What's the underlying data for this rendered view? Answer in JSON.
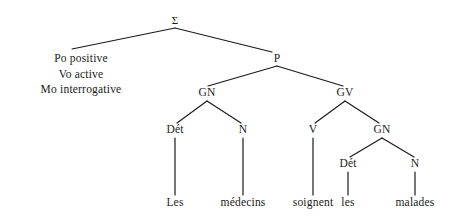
{
  "diagram": {
    "type": "syntax-tree",
    "title": "",
    "line_color": "#1a1a1a",
    "text_color": "#1a1a1a",
    "background_color": "#ffffff",
    "root": {
      "label": "Σ",
      "x": 175,
      "y": 20
    },
    "features": [
      {
        "label": "Po positive"
      },
      {
        "label": "Vo active"
      },
      {
        "label": "Mo interrogative"
      }
    ],
    "nodes": [
      {
        "id": "P",
        "label": "P",
        "x": 277,
        "y": 59
      },
      {
        "id": "GN1",
        "label": "GN",
        "x": 207,
        "y": 93
      },
      {
        "id": "GV",
        "label": "GV",
        "x": 345,
        "y": 93
      },
      {
        "id": "DET1",
        "label": "Dét",
        "x": 175,
        "y": 130
      },
      {
        "id": "N1",
        "label": "N",
        "x": 243,
        "y": 130
      },
      {
        "id": "V",
        "label": "V",
        "x": 313,
        "y": 130
      },
      {
        "id": "GN2",
        "label": "GN",
        "x": 382,
        "y": 130
      },
      {
        "id": "DET2",
        "label": "Dét",
        "x": 348,
        "y": 164
      },
      {
        "id": "N2",
        "label": "N",
        "x": 415,
        "y": 164
      }
    ],
    "terminals": [
      {
        "id": "les1",
        "label": "Les",
        "x": 175,
        "y": 203
      },
      {
        "id": "medecins",
        "label": "médecins",
        "x": 243,
        "y": 203
      },
      {
        "id": "soignent",
        "label": "soignent",
        "x": 313,
        "y": 203
      },
      {
        "id": "les2",
        "label": "les",
        "x": 348,
        "y": 203
      },
      {
        "id": "malades",
        "label": "malades",
        "x": 415,
        "y": 203
      }
    ],
    "edges": [
      {
        "from": "root",
        "to": "features",
        "x1": 175,
        "y1": 28,
        "x2": 72,
        "y2": 49
      },
      {
        "from": "root",
        "to": "P",
        "x1": 175,
        "y1": 28,
        "x2": 272,
        "y2": 52
      },
      {
        "from": "P",
        "to": "GN1",
        "x1": 277,
        "y1": 66,
        "x2": 208,
        "y2": 86
      },
      {
        "from": "P",
        "to": "GV",
        "x1": 277,
        "y1": 66,
        "x2": 343,
        "y2": 86
      },
      {
        "from": "GN1",
        "to": "DET1",
        "x1": 207,
        "y1": 101,
        "x2": 177,
        "y2": 123
      },
      {
        "from": "GN1",
        "to": "N1",
        "x1": 207,
        "y1": 101,
        "x2": 241,
        "y2": 123
      },
      {
        "from": "GV",
        "to": "V",
        "x1": 345,
        "y1": 101,
        "x2": 315,
        "y2": 123
      },
      {
        "from": "GV",
        "to": "GN2",
        "x1": 345,
        "y1": 101,
        "x2": 379,
        "y2": 123
      },
      {
        "from": "GN2",
        "to": "DET2",
        "x1": 382,
        "y1": 138,
        "x2": 350,
        "y2": 157
      },
      {
        "from": "GN2",
        "to": "N2",
        "x1": 382,
        "y1": 138,
        "x2": 414,
        "y2": 157
      },
      {
        "from": "DET1",
        "to": "les1",
        "x1": 175,
        "y1": 138,
        "x2": 175,
        "y2": 195
      },
      {
        "from": "N1",
        "to": "medecins",
        "x1": 243,
        "y1": 138,
        "x2": 243,
        "y2": 195
      },
      {
        "from": "V",
        "to": "soignent",
        "x1": 313,
        "y1": 138,
        "x2": 313,
        "y2": 195
      },
      {
        "from": "DET2",
        "to": "les2",
        "x1": 348,
        "y1": 172,
        "x2": 348,
        "y2": 195
      },
      {
        "from": "N2",
        "to": "malades",
        "x1": 415,
        "y1": 172,
        "x2": 415,
        "y2": 195
      }
    ],
    "sentence": "Les médecins soignent les malades"
  }
}
